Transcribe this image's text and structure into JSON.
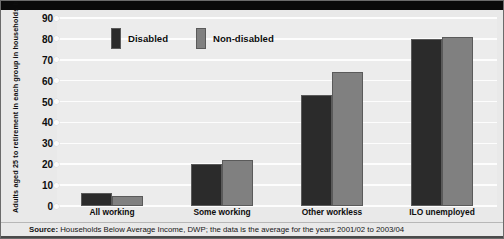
{
  "chart_data": {
    "type": "bar",
    "title": "",
    "xlabel": "",
    "ylabel": "Adults aged 25 to retirement in each group in households below 60% median income after deducting housing costs (per cent)",
    "categories": [
      "All working",
      "Some working",
      "Other workless",
      "ILO unemployed"
    ],
    "series": [
      {
        "name": "Disabled",
        "color": "#2b2b2b",
        "values": [
          6,
          20,
          53,
          80
        ]
      },
      {
        "name": "Non-disabled",
        "color": "#808080",
        "values": [
          5,
          22,
          64,
          81
        ]
      }
    ],
    "ylim": [
      0,
      90
    ],
    "yticks": [
      0,
      10,
      20,
      30,
      40,
      50,
      60,
      70,
      80,
      90
    ],
    "ytick_labels": [
      "0",
      "10",
      "20",
      "30",
      "40",
      "50",
      "60",
      "70",
      "80",
      "90"
    ],
    "grid": true,
    "legend_position": "top-left-inside",
    "annotations": []
  },
  "legend": {
    "items": [
      {
        "label": "Disabled",
        "color": "#2b2b2b"
      },
      {
        "label": "Non-disabled",
        "color": "#808080"
      }
    ]
  },
  "source": {
    "prefix": "Source:",
    "text": "Households Below Average Income, DWP; the data is the average for the years 2001/02 to 2003/04"
  },
  "colors": {
    "disabled": "#2b2b2b",
    "non_disabled": "#808080",
    "plot_background": "#ececec",
    "gridline": "#fdfdfd",
    "frame": "#6b6b6b"
  }
}
